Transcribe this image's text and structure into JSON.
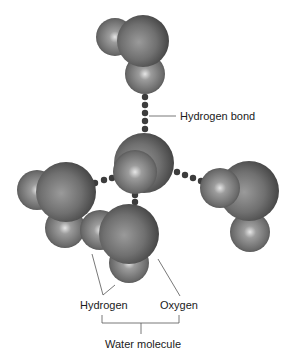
{
  "diagram": {
    "labels": {
      "hydrogen_bond": "Hydrogen bond",
      "hydrogen": "Hydrogen",
      "oxygen": "Oxygen",
      "water_molecule": "Water molecule"
    },
    "colors": {
      "atom_base": "#6e6e6e",
      "atom_highlight": "#d8d8d8",
      "atom_shadow": "#3a3a3a",
      "bond_dot": "#3c3c3c",
      "leader_line": "#555555",
      "text": "#1a1a1a"
    },
    "molecules": [
      {
        "name": "top",
        "atoms": [
          {
            "type": "H"
          },
          {
            "type": "O"
          },
          {
            "type": "H"
          }
        ]
      },
      {
        "name": "center",
        "atoms": [
          {
            "type": "O"
          },
          {
            "type": "H"
          }
        ]
      },
      {
        "name": "left",
        "atoms": [
          {
            "type": "H"
          },
          {
            "type": "O"
          },
          {
            "type": "H"
          }
        ]
      },
      {
        "name": "right",
        "atoms": [
          {
            "type": "H"
          },
          {
            "type": "O"
          },
          {
            "type": "H"
          }
        ]
      },
      {
        "name": "bottom",
        "atoms": [
          {
            "type": "H"
          },
          {
            "type": "O"
          },
          {
            "type": "H"
          }
        ]
      }
    ]
  }
}
